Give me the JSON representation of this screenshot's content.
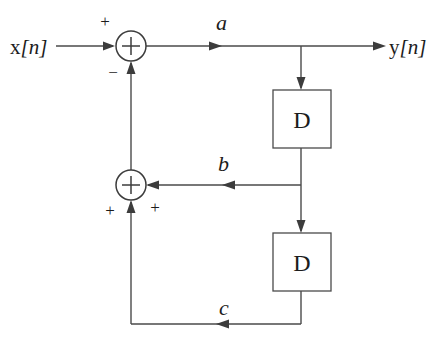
{
  "diagram": {
    "type": "block-diagram",
    "canvas": {
      "width": 442,
      "height": 339,
      "background": "#ffffff"
    },
    "colors": {
      "wire": "#4a4a4a",
      "node_stroke": "#3c3c3c",
      "box_stroke": "#4a4a4a",
      "text": "#1c1c1c",
      "background": "#ffffff"
    },
    "input": {
      "label_base": "x",
      "label_index": "[n]",
      "label_full": "x[n]"
    },
    "output": {
      "label_base": "y",
      "label_index": "[n]",
      "label_full": "y[n]"
    },
    "summing_nodes": [
      {
        "id": "sum-top",
        "operator": "+",
        "center": {
          "x": 131,
          "y": 46
        },
        "radius": 15,
        "signs": [
          {
            "value": "+",
            "position": "top-left",
            "x": 105,
            "y": 27
          },
          {
            "value": "−",
            "position": "bottom-left",
            "x": 113,
            "y": 72
          }
        ]
      },
      {
        "id": "sum-bottom",
        "operator": "+",
        "center": {
          "x": 131,
          "y": 185
        },
        "radius": 15,
        "signs": [
          {
            "value": "+",
            "position": "right-below",
            "x": 155,
            "y": 208
          },
          {
            "value": "+",
            "position": "left-below",
            "x": 110,
            "y": 211
          }
        ]
      }
    ],
    "delay_blocks": [
      {
        "id": "delay-1",
        "label": "D",
        "x": 273,
        "y": 90,
        "width": 58,
        "height": 58
      },
      {
        "id": "delay-2",
        "label": "D",
        "x": 273,
        "y": 233,
        "width": 58,
        "height": 58
      }
    ],
    "signal_labels": [
      {
        "id": "label-a",
        "text": "a",
        "x": 216,
        "y": 30
      },
      {
        "id": "label-b",
        "text": "b",
        "x": 218,
        "y": 171
      },
      {
        "id": "label-c",
        "text": "c",
        "x": 219,
        "y": 315
      }
    ],
    "branch_points": [
      {
        "id": "tap-output",
        "x": 301,
        "y": 46
      },
      {
        "id": "tap-b",
        "x": 301,
        "y": 185
      }
    ],
    "connections": [
      {
        "from": "input",
        "to": "sum-top",
        "signal": "x[n]"
      },
      {
        "from": "sum-top",
        "to": "output",
        "signal": "a"
      },
      {
        "from": "tap-output",
        "to": "delay-1",
        "signal": "a"
      },
      {
        "from": "delay-1",
        "to": "tap-b",
        "signal": "b"
      },
      {
        "from": "tap-b",
        "to": "sum-bottom",
        "signal": "b"
      },
      {
        "from": "tap-b",
        "to": "delay-2",
        "signal": "b"
      },
      {
        "from": "delay-2",
        "to": "sum-bottom",
        "signal": "c"
      },
      {
        "from": "sum-bottom",
        "to": "sum-top",
        "signal": "feedback"
      }
    ]
  }
}
